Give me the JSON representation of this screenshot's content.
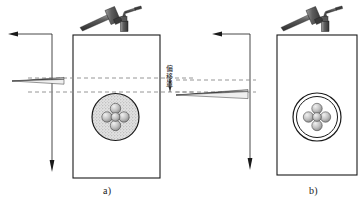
{
  "figure": {
    "title": "",
    "panels": [
      {
        "id": "a",
        "caption": "a)",
        "workpiece": {
          "shape": "rectangle",
          "fill": "#ffffff",
          "stroke": "#1a1a1a"
        },
        "target": {
          "outer_circle": {
            "fill": "#dcdcdc",
            "pattern": "stippled",
            "stroke": "#1a1a1a"
          },
          "punch_marks": 5,
          "punch_fill": "#bfbfbf"
        },
        "tools": [
          "hammer-icon",
          "center-punch-icon"
        ],
        "scriber": {
          "name": "scriber-icon",
          "aligned_to": "upper-dashed-line"
        },
        "reference_lines": [
          "upper-dashed-line",
          "lower-dashed-line"
        ],
        "offset_label": "偏移量",
        "arrows": [
          "left-arrow",
          "down-arrow"
        ]
      },
      {
        "id": "b",
        "caption": "b)",
        "workpiece": {
          "shape": "rectangle",
          "fill": "#ffffff",
          "stroke": "#1a1a1a"
        },
        "target": {
          "outer_circle": {
            "fill": "#ffffff",
            "pattern": "plain",
            "stroke": "#1a1a1a"
          },
          "punch_marks": 5,
          "punch_fill": "#bfbfbf"
        },
        "tools": [
          "hammer-icon",
          "center-punch-icon"
        ],
        "scriber": {
          "name": "scriber-icon",
          "aligned_to": "lower-dashed-line"
        },
        "reference_lines": [
          "upper-dashed-line",
          "lower-dashed-line"
        ],
        "offset_label": "",
        "arrows": [
          "left-arrow",
          "down-arrow"
        ]
      }
    ],
    "colors": {
      "line": "#1a1a1a",
      "dashed": "#808080",
      "stipple": "#d8d8d8",
      "metal_light": "#cccccc",
      "metal_dark": "#6e6e6e"
    }
  }
}
